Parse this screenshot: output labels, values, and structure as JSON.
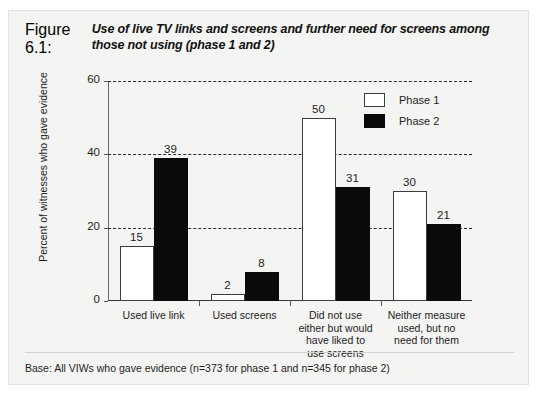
{
  "figure": {
    "number": "Figure 6.1:",
    "caption": "Use of live TV links and screens and further need for screens among those not using (phase 1 and 2)",
    "footnote": "Base:  All VIWs who gave evidence (n=373 for phase 1 and n=345 for phase 2)"
  },
  "chart_data": {
    "type": "bar",
    "title": "Use of live TV links and screens and further need for screens among those not using (phase 1 and 2)",
    "xlabel": "",
    "ylabel": "Percent of witnesses who gave evidence",
    "ylim": [
      0,
      60
    ],
    "yticks": [
      0,
      20,
      40,
      60
    ],
    "ytick_labels": [
      "0",
      "20",
      "40",
      "60"
    ],
    "grid": "horizontal-dashed",
    "legend_position": "top-right-inside",
    "categories": [
      "Used live link",
      "Used screens",
      "Did not use either but would have liked to use screens",
      "Neither measure used, but no need for them"
    ],
    "category_lines": [
      [
        "Used live link"
      ],
      [
        "Used screens"
      ],
      [
        "Did not use",
        "either but would",
        "have liked to",
        "use screens"
      ],
      [
        "Neither measure",
        "used, but no",
        "need for them"
      ]
    ],
    "series": [
      {
        "name": "Phase 1",
        "color": "#ffffff",
        "edge_color": "#3c3c3c",
        "values": [
          15,
          2,
          50,
          30
        ],
        "value_labels": [
          "15",
          "2",
          "50",
          "30"
        ]
      },
      {
        "name": "Phase 2",
        "color": "#0a0a0a",
        "edge_color": "#0a0a0a",
        "values": [
          39,
          8,
          31,
          21
        ],
        "value_labels": [
          "39",
          "8",
          "31",
          "21"
        ]
      }
    ]
  }
}
